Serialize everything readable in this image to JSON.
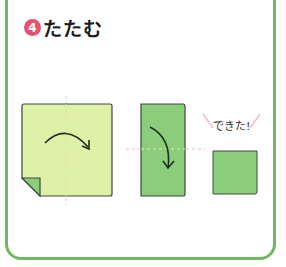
{
  "step": {
    "number": "4",
    "title": "たたむ"
  },
  "diagram": {
    "done_label": "できた!",
    "colors": {
      "frame_border": "#6dba5f",
      "badge": "#e8506f",
      "paper_light": "#dff0a8",
      "paper_green": "#8ccd7c",
      "fold_line": "#f2b8c0",
      "outline": "#3a4a3a"
    },
    "panels": [
      {
        "name": "square-paper",
        "description": "light square with corner fold, curved arrow folding left to right"
      },
      {
        "name": "folded-rectangle",
        "description": "green rectangle, curved arrow folding top to bottom"
      },
      {
        "name": "finished-square",
        "description": "small green square, completed"
      }
    ]
  }
}
